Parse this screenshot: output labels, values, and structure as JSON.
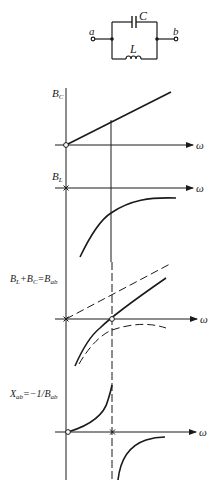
{
  "circuit": {
    "terminal_a": "a",
    "terminal_b": "b",
    "capacitor_label": "C",
    "inductor_label": "L",
    "topology": "parallel LC between terminals a and b"
  },
  "axis_label_x": "ω",
  "plots": [
    {
      "id": "bc",
      "ylabel_main": "B",
      "ylabel_sub": "C",
      "description": "Capacitive susceptance, linear increasing from origin",
      "origin_marker": "circle"
    },
    {
      "id": "bl",
      "ylabel_main": "B",
      "ylabel_sub": "L",
      "description": "Inductive susceptance, negative, approaching zero from below (pole at origin)",
      "origin_marker": "cross"
    },
    {
      "id": "bab",
      "ylabel": "B_L+B_C=B_ab",
      "ylabel_parts": [
        "B",
        "L",
        "+B",
        "C",
        "=B",
        "ab"
      ],
      "description": "Sum of susceptances; dashed curves show B_C and B_L; zero at resonance",
      "origin_marker": "cross",
      "resonance_marker": "circle"
    },
    {
      "id": "xab",
      "ylabel": "X_ab=-1/B_ab",
      "ylabel_parts": [
        "X",
        "ab",
        "=−1/B",
        "ab"
      ],
      "description": "Reactance; zero at origin, pole at resonance",
      "origin_marker": "circle",
      "resonance_marker": "cross"
    }
  ],
  "colors": {
    "ink": "#1a1a1a",
    "background": "#ffffff"
  }
}
